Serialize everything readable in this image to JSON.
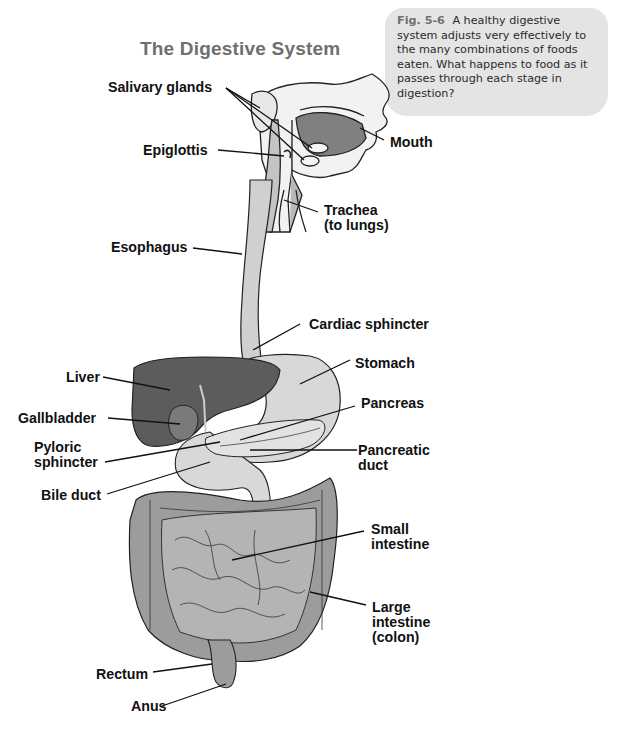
{
  "title": "The Digestive System",
  "caption": {
    "fig_number": "Fig. 5-6",
    "text": "A healthy digestive system adjusts very effectively to the many combinations of foods eaten. What happens to food as it passes through each stage in digestion?"
  },
  "labels": {
    "salivary_glands": "Salivary glands",
    "mouth": "Mouth",
    "epiglottis": "Epiglottis",
    "trachea_1": "Trachea",
    "trachea_2": "(to lungs)",
    "esophagus": "Esophagus",
    "cardiac_sphincter": "Cardiac sphincter",
    "liver": "Liver",
    "stomach": "Stomach",
    "gallbladder": "Gallbladder",
    "pancreas": "Pancreas",
    "pyloric_1": "Pyloric",
    "pyloric_2": "sphincter",
    "pancreatic_duct_1": "Pancreatic",
    "pancreatic_duct_2": "duct",
    "bile_duct": "Bile duct",
    "small_intestine_1": "Small",
    "small_intestine_2": "intestine",
    "large_intestine_1": "Large",
    "large_intestine_2": "intestine",
    "large_intestine_3": "(colon)",
    "rectum": "Rectum",
    "anus": "Anus"
  },
  "colors": {
    "title": "#6f6f6f",
    "caption_bg": "#e4e4e4",
    "liver": "#5a5a5a",
    "organ_light": "#cfcfcf",
    "organ_mid": "#9a9a9a"
  }
}
